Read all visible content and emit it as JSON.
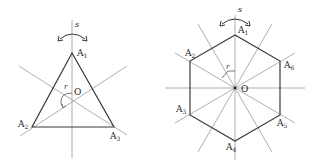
{
  "figure": {
    "triangle": {
      "vertices": [
        {
          "name": "A",
          "sub": "1"
        },
        {
          "name": "A",
          "sub": "2"
        },
        {
          "name": "A",
          "sub": "3"
        }
      ],
      "center_label": "O",
      "reflection_label": "s",
      "rotation_label": "r"
    },
    "hexagon": {
      "vertices": [
        {
          "name": "A",
          "sub": "1"
        },
        {
          "name": "A",
          "sub": "2"
        },
        {
          "name": "A",
          "sub": "3"
        },
        {
          "name": "A",
          "sub": "4"
        },
        {
          "name": "A",
          "sub": "5"
        },
        {
          "name": "A",
          "sub": "6"
        }
      ],
      "center_label": "O",
      "reflection_label": "s",
      "rotation_label": "r"
    },
    "colors": {
      "polygon": "#3a3a3a",
      "axes": "#9a9a9a",
      "text": "#222222"
    }
  }
}
